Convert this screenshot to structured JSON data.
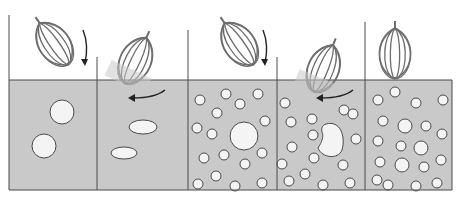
{
  "diagram": {
    "colors": {
      "liquid": "#c9c9c9",
      "bubble": "#f4f4f4",
      "outline": "#4a4a4a",
      "whisk": "#6d6d6d",
      "background": "#ffffff"
    },
    "surface_y": 80,
    "bottom_y": 190,
    "panels": [
      {
        "id": "panel-1",
        "x0": 9,
        "x1": 97,
        "top": 15,
        "whisk": {
          "cx": 55,
          "cy": 45,
          "angle": -35,
          "dipped": false
        },
        "arrow": "down-curve",
        "bubbles": [
          {
            "cx": 62,
            "cy": 112,
            "rx": 12,
            "ry": 12
          },
          {
            "cx": 44,
            "cy": 146,
            "rx": 12,
            "ry": 12
          }
        ]
      },
      {
        "id": "panel-2",
        "x0": 97,
        "x1": 188,
        "top": 57,
        "whisk": {
          "cx": 135,
          "cy": 62,
          "angle": 25,
          "dipped": true
        },
        "arrow": "left-curve",
        "bubbles": [
          {
            "cx": 143,
            "cy": 127,
            "rx": 14,
            "ry": 7
          },
          {
            "cx": 124,
            "cy": 153,
            "rx": 13,
            "ry": 6
          }
        ]
      },
      {
        "id": "panel-3",
        "x0": 188,
        "x1": 277,
        "top": 30,
        "whisk": {
          "cx": 240,
          "cy": 45,
          "angle": -35,
          "dipped": false
        },
        "arrow": "down-curve",
        "bubbles": [
          {
            "cx": 244,
            "cy": 136,
            "rx": 14,
            "ry": 14
          },
          {
            "cx": 200,
            "cy": 100,
            "rx": 5,
            "ry": 5
          },
          {
            "cx": 226,
            "cy": 94,
            "rx": 5,
            "ry": 5
          },
          {
            "cx": 258,
            "cy": 94,
            "rx": 5,
            "ry": 5
          },
          {
            "cx": 240,
            "cy": 104,
            "rx": 5,
            "ry": 5
          },
          {
            "cx": 217,
            "cy": 113,
            "rx": 5,
            "ry": 5
          },
          {
            "cx": 197,
            "cy": 128,
            "rx": 5,
            "ry": 5
          },
          {
            "cx": 212,
            "cy": 134,
            "rx": 5,
            "ry": 5
          },
          {
            "cx": 265,
            "cy": 121,
            "rx": 5,
            "ry": 5
          },
          {
            "cx": 262,
            "cy": 153,
            "rx": 5,
            "ry": 5
          },
          {
            "cx": 224,
            "cy": 155,
            "rx": 5,
            "ry": 5
          },
          {
            "cx": 204,
            "cy": 158,
            "rx": 5,
            "ry": 5
          },
          {
            "cx": 245,
            "cy": 164,
            "rx": 5,
            "ry": 5
          },
          {
            "cx": 216,
            "cy": 176,
            "rx": 5,
            "ry": 5
          },
          {
            "cx": 198,
            "cy": 184,
            "rx": 5,
            "ry": 5
          },
          {
            "cx": 235,
            "cy": 186,
            "rx": 5,
            "ry": 5
          },
          {
            "cx": 262,
            "cy": 183,
            "rx": 5,
            "ry": 5
          }
        ]
      },
      {
        "id": "panel-4",
        "x0": 277,
        "x1": 365,
        "top": 57,
        "whisk": {
          "cx": 323,
          "cy": 70,
          "angle": 22,
          "dipped": true
        },
        "arrow": "left-curve",
        "bubbles": [
          {
            "cx": 330,
            "cy": 140,
            "rx": 13,
            "ry": 17,
            "blob": true
          },
          {
            "cx": 285,
            "cy": 103,
            "rx": 5,
            "ry": 5
          },
          {
            "cx": 344,
            "cy": 110,
            "rx": 5,
            "ry": 5
          },
          {
            "cx": 353,
            "cy": 114,
            "rx": 5,
            "ry": 5
          },
          {
            "cx": 312,
            "cy": 119,
            "rx": 5,
            "ry": 5
          },
          {
            "cx": 291,
            "cy": 122,
            "rx": 5,
            "ry": 5
          },
          {
            "cx": 313,
            "cy": 135,
            "rx": 5,
            "ry": 5
          },
          {
            "cx": 356,
            "cy": 139,
            "rx": 5,
            "ry": 5
          },
          {
            "cx": 292,
            "cy": 147,
            "rx": 5,
            "ry": 5
          },
          {
            "cx": 314,
            "cy": 158,
            "rx": 5,
            "ry": 5
          },
          {
            "cx": 282,
            "cy": 164,
            "rx": 5,
            "ry": 5
          },
          {
            "cx": 343,
            "cy": 165,
            "rx": 5,
            "ry": 5
          },
          {
            "cx": 305,
            "cy": 174,
            "rx": 5,
            "ry": 5
          },
          {
            "cx": 289,
            "cy": 181,
            "rx": 5,
            "ry": 5
          },
          {
            "cx": 323,
            "cy": 185,
            "rx": 5,
            "ry": 5
          },
          {
            "cx": 350,
            "cy": 183,
            "rx": 5,
            "ry": 5
          }
        ]
      },
      {
        "id": "panel-5",
        "x0": 365,
        "x1": 452,
        "top": 22,
        "whisk": {
          "cx": 395,
          "cy": 55,
          "angle": 0,
          "dipped": false
        },
        "arrow": "none",
        "bubbles": [
          {
            "cx": 395,
            "cy": 92,
            "rx": 5,
            "ry": 5
          },
          {
            "cx": 378,
            "cy": 100,
            "rx": 5,
            "ry": 5
          },
          {
            "cx": 416,
            "cy": 103,
            "rx": 5,
            "ry": 5
          },
          {
            "cx": 443,
            "cy": 100,
            "rx": 5,
            "ry": 5
          },
          {
            "cx": 383,
            "cy": 121,
            "rx": 5,
            "ry": 5
          },
          {
            "cx": 405,
            "cy": 126,
            "rx": 7,
            "ry": 7
          },
          {
            "cx": 426,
            "cy": 126,
            "rx": 5,
            "ry": 5
          },
          {
            "cx": 442,
            "cy": 134,
            "rx": 5,
            "ry": 5
          },
          {
            "cx": 378,
            "cy": 141,
            "rx": 5,
            "ry": 5
          },
          {
            "cx": 401,
            "cy": 146,
            "rx": 5,
            "ry": 5
          },
          {
            "cx": 421,
            "cy": 148,
            "rx": 7,
            "ry": 7
          },
          {
            "cx": 380,
            "cy": 162,
            "rx": 5,
            "ry": 5
          },
          {
            "cx": 402,
            "cy": 165,
            "rx": 7,
            "ry": 7
          },
          {
            "cx": 424,
            "cy": 167,
            "rx": 5,
            "ry": 5
          },
          {
            "cx": 441,
            "cy": 160,
            "rx": 5,
            "ry": 5
          },
          {
            "cx": 377,
            "cy": 180,
            "rx": 5,
            "ry": 5
          },
          {
            "cx": 388,
            "cy": 185,
            "rx": 5,
            "ry": 5
          },
          {
            "cx": 416,
            "cy": 186,
            "rx": 5,
            "ry": 5
          },
          {
            "cx": 437,
            "cy": 183,
            "rx": 5,
            "ry": 5
          }
        ]
      }
    ]
  }
}
